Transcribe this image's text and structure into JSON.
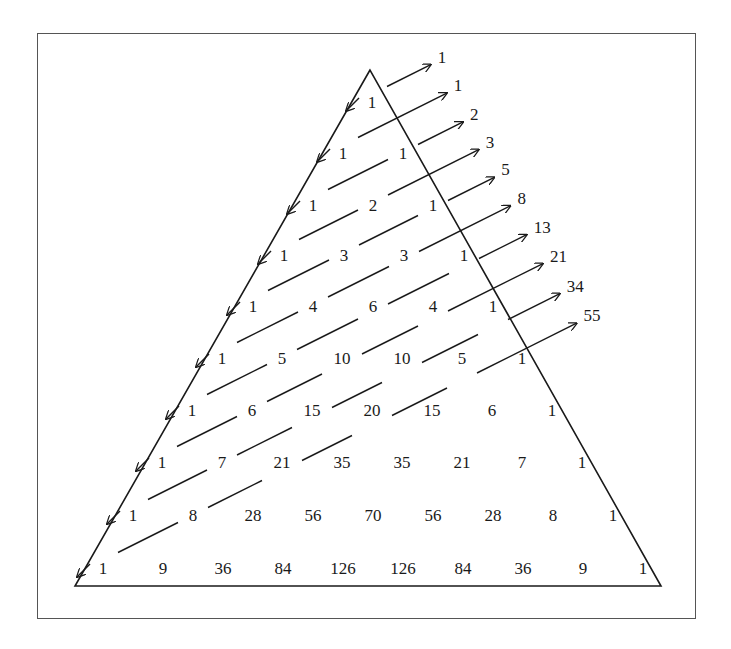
{
  "figure": {
    "rows": [
      [
        "1"
      ],
      [
        "1",
        "1"
      ],
      [
        "1",
        "2",
        "1"
      ],
      [
        "1",
        "3",
        "3",
        "1"
      ],
      [
        "1",
        "4",
        "6",
        "4",
        "1"
      ],
      [
        "1",
        "5",
        "10",
        "10",
        "5",
        "1"
      ],
      [
        "1",
        "6",
        "15",
        "20",
        "15",
        "6",
        "1"
      ],
      [
        "1",
        "7",
        "21",
        "35",
        "35",
        "21",
        "7",
        "1"
      ],
      [
        "1",
        "8",
        "28",
        "56",
        "70",
        "56",
        "28",
        "8",
        "1"
      ],
      [
        "1",
        "9",
        "36",
        "84",
        "126",
        "126",
        "84",
        "36",
        "9",
        "1"
      ]
    ],
    "diagonal_sums": [
      "1",
      "1",
      "2",
      "3",
      "5",
      "8",
      "13",
      "21",
      "34",
      "55"
    ],
    "colors": {
      "line": "#1a1a1a",
      "frame": "#555555",
      "background": "#ffffff"
    }
  }
}
